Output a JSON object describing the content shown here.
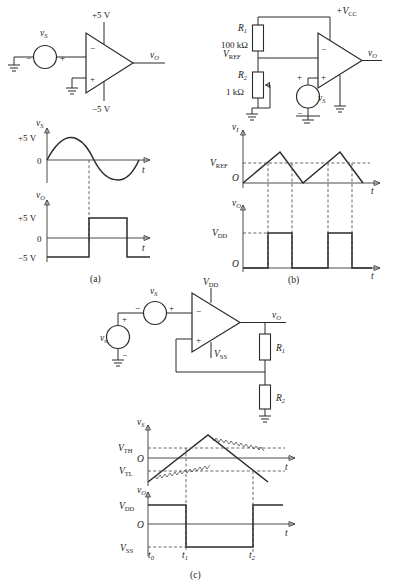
{
  "figure": {
    "captions": {
      "a": "(a)",
      "b": "(b)",
      "c": "(c)"
    }
  },
  "panel_a": {
    "circuit": {
      "source_label": "v",
      "source_sub": "S",
      "vpos": "+5 V",
      "vneg": "−5 V",
      "out_label": "v",
      "out_sub": "O",
      "minus": "−",
      "plus": "+",
      "src_minus": "−",
      "src_plus": "+"
    },
    "wave_in": {
      "y_label": "v",
      "y_sub": "S",
      "top": "+5 V",
      "zero": "0",
      "x_label": "t"
    },
    "wave_out": {
      "y_label": "v",
      "y_sub": "O",
      "top": "+5 V",
      "zero": "0",
      "bottom": "−5 V",
      "x_label": "t"
    }
  },
  "panel_b": {
    "circuit": {
      "r1_label": "R",
      "r1_sub": "1",
      "r1_value": "100 kΩ",
      "r2_label": "R",
      "r2_sub": "2",
      "r2_value": "1 kΩ",
      "vref_label": "V",
      "vref_sub": "REF",
      "vcc_label": "+V",
      "vcc_sub": "CC",
      "source_label": "v",
      "source_sub": "S",
      "out_label": "v",
      "out_sub": "O",
      "minus": "−",
      "plus": "+",
      "src_plus": "+",
      "src_minus": "−"
    },
    "wave_in": {
      "y_label": "v",
      "y_sub": "I",
      "ref": "V",
      "ref_sub": "REF",
      "origin": "O",
      "x_label": "t"
    },
    "wave_out": {
      "y_label": "v",
      "y_sub": "O",
      "high": "V",
      "high_sub": "DD",
      "origin": "O",
      "x_label": "t"
    }
  },
  "panel_c": {
    "circuit": {
      "vs_label": "v",
      "vs_sub": "S",
      "vn_label": "v",
      "vn_sub": "n",
      "vdd_label": "V",
      "vdd_sub": "DD",
      "vss_label": "V",
      "vss_sub": "SS",
      "out_label": "v",
      "out_sub": "O",
      "r1_label": "R",
      "r1_sub": "1",
      "r2_label": "R",
      "r2_sub": "2",
      "minus": "−",
      "plus": "+",
      "vs_minus": "−",
      "vs_plus": "+",
      "vn_plus": "+",
      "vn_minus": "−"
    },
    "wave_in": {
      "y_label": "v",
      "y_sub": "S",
      "vth": "V",
      "vth_sub": "TH",
      "vtl": "V",
      "vtl_sub": "TL",
      "origin": "O",
      "x_label": "t"
    },
    "wave_out": {
      "y_label": "v",
      "y_sub": "O",
      "vdd": "V",
      "vdd_sub": "DD",
      "vss": "V",
      "vss_sub": "SS",
      "origin": "O",
      "x_label": "t",
      "t0": "t",
      "t0_sub": "0",
      "t1": "t",
      "t1_sub": "1",
      "t2": "t",
      "t2_sub": "2"
    }
  }
}
